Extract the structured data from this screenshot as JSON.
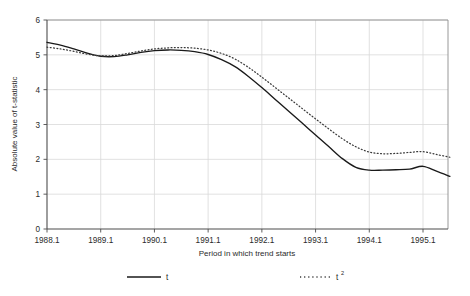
{
  "chart_data": {
    "type": "line",
    "title": "",
    "xlabel": "Period in which trend starts",
    "ylabel": "Absolute value of t-statistic",
    "ylim": [
      0,
      6
    ],
    "yticks": [
      0,
      1,
      2,
      3,
      4,
      5,
      6
    ],
    "ytick_labels": [
      "0",
      "1",
      "2",
      "3",
      "4",
      "5",
      "6"
    ],
    "xlim": [
      1988.1,
      1995.4
    ],
    "xticks": [
      1988.1,
      1989.1,
      1990.1,
      1991.1,
      1992.1,
      1993.1,
      1994.1,
      1995.1
    ],
    "xtick_labels": [
      "1988.1",
      "1989.1",
      "1990.1",
      "1991.1",
      "1992.1",
      "1993.1",
      "1994.1",
      "1995.1"
    ],
    "grid": true,
    "grid_color": "#d9d9d9",
    "axis_color": "#808080",
    "legend_position": "bottom",
    "x": [
      "1988.1",
      "1988.2",
      "1988.3",
      "1988.4",
      "1989.1",
      "1989.2",
      "1989.3",
      "1989.4",
      "1990.1",
      "1990.2",
      "1990.3",
      "1990.4",
      "1991.1",
      "1991.2",
      "1991.3",
      "1991.4",
      "1992.1",
      "1992.2",
      "1992.3",
      "1992.4",
      "1993.1",
      "1993.2",
      "1993.3",
      "1993.4",
      "1994.1",
      "1994.2",
      "1994.3",
      "1994.4",
      "1995.1",
      "1995.2",
      "1995.3"
    ],
    "series": [
      {
        "name": "t",
        "style": "solid",
        "color": "#1a1a1a",
        "values": [
          5.36,
          5.28,
          5.17,
          5.05,
          4.96,
          4.95,
          5.0,
          5.07,
          5.12,
          5.14,
          5.13,
          5.09,
          5.01,
          4.86,
          4.66,
          4.38,
          4.06,
          3.72,
          3.38,
          3.04,
          2.7,
          2.36,
          2.02,
          1.77,
          1.69,
          1.69,
          1.7,
          1.72,
          1.8,
          1.66,
          1.51
        ]
      },
      {
        "name": "t2",
        "style": "dotted",
        "color": "#3a3a3a",
        "values": [
          5.22,
          5.17,
          5.1,
          5.02,
          4.97,
          4.98,
          5.04,
          5.11,
          5.17,
          5.2,
          5.21,
          5.19,
          5.14,
          5.04,
          4.88,
          4.64,
          4.36,
          4.06,
          3.76,
          3.46,
          3.16,
          2.87,
          2.59,
          2.36,
          2.21,
          2.16,
          2.17,
          2.2,
          2.22,
          2.14,
          2.06
        ]
      }
    ]
  },
  "legend": {
    "items": [
      {
        "label": "t",
        "sup": "",
        "style": "solid"
      },
      {
        "label": "t",
        "sup": "2",
        "style": "dotted"
      }
    ]
  },
  "axes": {
    "y_title": "Absolute value of t-statistic",
    "x_title": "Period in which trend starts"
  }
}
